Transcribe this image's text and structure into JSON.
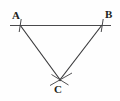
{
  "figure": {
    "background_color": "#fefefe",
    "stroke_color": "#3a3a3c",
    "label_color": "#231f20",
    "width": 120,
    "height": 101,
    "labels": {
      "a": "A",
      "b": "B",
      "c": "C"
    },
    "vertices": {
      "A": {
        "x": 20,
        "y": 25
      },
      "B": {
        "x": 102,
        "y": 25
      },
      "C": {
        "x": 60,
        "y": 80
      }
    },
    "baseline": {
      "name": "horizontal-baseline",
      "x1": 10,
      "y1": 25,
      "x2": 111,
      "y2": 25
    },
    "sides": [
      {
        "name": "side-AC",
        "x1": 20,
        "y1": 25,
        "x2": 61,
        "y2": 81
      },
      {
        "name": "side-BC",
        "x1": 102,
        "y1": 25,
        "x2": 59,
        "y2": 81
      }
    ],
    "tick_marks": [
      {
        "name": "tick-at-A",
        "x1": 21,
        "y1": 19,
        "x2": 19,
        "y2": 32
      },
      {
        "name": "tick-at-B",
        "x1": 103,
        "y1": 19,
        "x2": 101,
        "y2": 32
      }
    ],
    "construction_arcs": [
      {
        "name": "arc-mark-left",
        "x1": 50,
        "y1": 85,
        "x2": 72,
        "y2": 73
      },
      {
        "name": "arc-mark-right",
        "x1": 68,
        "y1": 85,
        "x2": 52,
        "y2": 74
      }
    ]
  }
}
